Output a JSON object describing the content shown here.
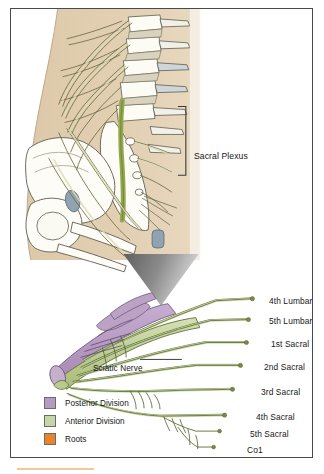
{
  "figure": {
    "type": "anatomical-illustration",
    "subject": "Sacral Plexus",
    "upper_panel": {
      "description": "Lateral view of lumbosacral spine, sacrum and pelvis with nerve roots",
      "bracket_label": "Sacral Plexus"
    },
    "lower_panel": {
      "description": "Schematic of lumbosacral plexus showing anterior and posterior divisions converging into the sciatic nerve",
      "callout_label": "Sciatic Nerve",
      "root_labels": [
        "4th Lumbar",
        "5th Lumbar",
        "1st Sacral",
        "2nd Sacral",
        "3rd Sacral",
        "4th Sacral",
        "5th Sacral",
        "Co1"
      ]
    },
    "legend": {
      "items": [
        {
          "label": "Posterior Division",
          "color": "#b59ac1"
        },
        {
          "label": "Anterior Division",
          "color": "#c7d6a6"
        },
        {
          "label": "Roots",
          "color": "#e8852c"
        }
      ]
    },
    "colors": {
      "body_tan": "#e2cfb2",
      "bone_white": "#fdfcf6",
      "nerve_green": "#8a9a52",
      "nerve_pale": "#e8e6c8",
      "spinal_cord_green": "#9ab04f",
      "disc_blue_gray": "#8fa3b0",
      "highlight_yellow": "#f0e2a8",
      "wedge_gray": "#6e6e6e",
      "frame": "#4a4a4a",
      "posterior_division": "#b59ac1",
      "anterior_division": "#c7d6a6",
      "roots": "#e8852c"
    }
  },
  "footer_rule": {
    "color": "#e8b87a"
  }
}
